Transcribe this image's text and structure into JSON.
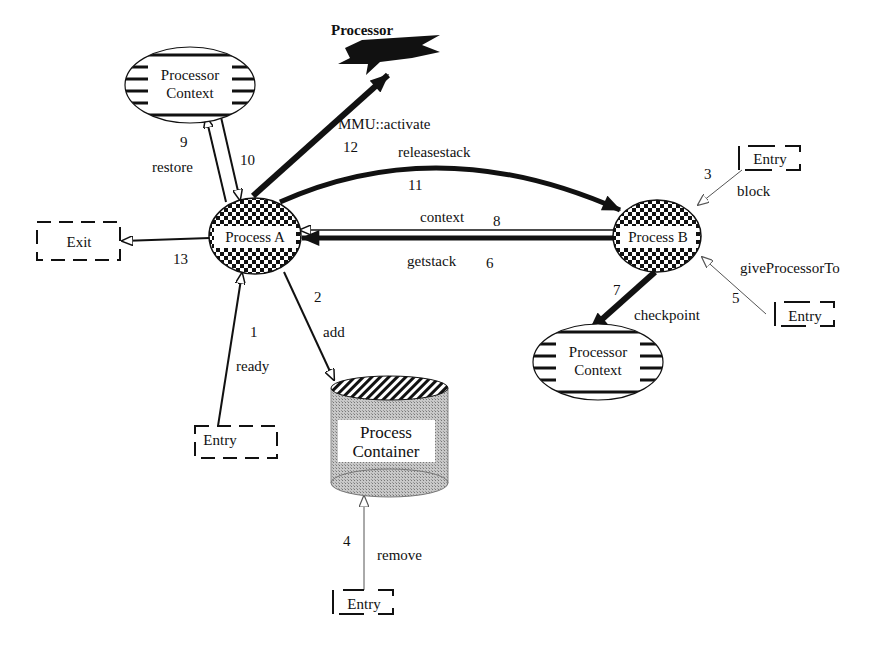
{
  "diagram": {
    "nodes": {
      "processor": {
        "label": "Processor"
      },
      "processor_context_top": {
        "line1": "Processor",
        "line2": "Context"
      },
      "processor_context_bottom": {
        "line1": "Processor",
        "line2": "Context"
      },
      "process_a": {
        "label": "Process A"
      },
      "process_b": {
        "label": "Process B"
      },
      "process_container": {
        "line1": "Process",
        "line2": "Container"
      },
      "exit": {
        "label": "Exit"
      },
      "entry_ready": {
        "label": "Entry"
      },
      "entry_block": {
        "label": "Entry"
      },
      "entry_give": {
        "label": "Entry"
      },
      "entry_remove": {
        "label": "Entry"
      }
    },
    "edges": [
      {
        "id": "ready",
        "step": "1",
        "label": "ready",
        "from": "Entry",
        "to": "Process A"
      },
      {
        "id": "add",
        "step": "2",
        "label": "add",
        "from": "Process A",
        "to": "Process Container"
      },
      {
        "id": "block",
        "step": "3",
        "label": "block",
        "from": "Entry",
        "to": "Process B"
      },
      {
        "id": "remove",
        "step": "4",
        "label": "remove",
        "from": "Entry",
        "to": "Process Container"
      },
      {
        "id": "giveProcessorTo",
        "step": "5",
        "label": "giveProcessorTo",
        "from": "Entry",
        "to": "Process B"
      },
      {
        "id": "getstack",
        "step": "6",
        "label": "getstack",
        "from": "Process B",
        "to": "Process A"
      },
      {
        "id": "checkpoint",
        "step": "7",
        "label": "checkpoint",
        "from": "Process B",
        "to": "Processor Context"
      },
      {
        "id": "context",
        "step": "8",
        "label": "context",
        "from": "Process B",
        "to": "Process A"
      },
      {
        "id": "restore",
        "step": "9",
        "label": "restore",
        "from": "Process A",
        "to": "Processor Context"
      },
      {
        "id": "ten",
        "step": "10",
        "label": "",
        "from": "Processor Context",
        "to": "Process A"
      },
      {
        "id": "releasestack",
        "step": "11",
        "label": "releasestack",
        "from": "Process A",
        "to": "Process B"
      },
      {
        "id": "activate",
        "step": "12",
        "label": "MMU::activate",
        "from": "Process A",
        "to": "Processor"
      },
      {
        "id": "exit",
        "step": "13",
        "label": "",
        "from": "Process A",
        "to": "Exit"
      }
    ]
  },
  "colors": {
    "ink": "#111111",
    "container_fill": "#b8b8b8",
    "background": "#ffffff"
  }
}
